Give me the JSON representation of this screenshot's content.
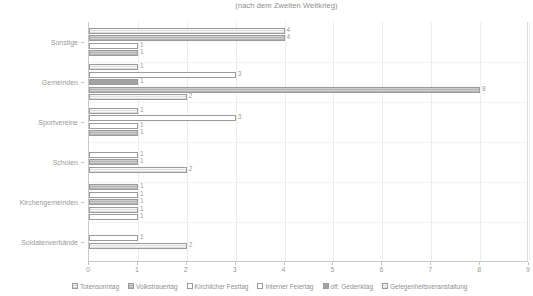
{
  "chart_data": {
    "type": "bar",
    "orientation": "horizontal",
    "title": "(nach dem Zweiten Weltkrieg)",
    "xlabel": "",
    "ylabel": "",
    "xlim": [
      0,
      9
    ],
    "xticks": [
      "0",
      "1",
      "2",
      "3",
      "4",
      "5",
      "6",
      "7",
      "8",
      "9"
    ],
    "grid": true,
    "legend_position": "bottom",
    "categories": [
      "Sonstige",
      "Gemeinden",
      "Sportvereine",
      "Schulen",
      "Kirchengemeinden",
      "Soldatenverbände"
    ],
    "series": [
      {
        "name": "Totensonntag",
        "values": [
          4,
          1,
          1,
          1,
          1,
          0
        ]
      },
      {
        "name": "Volkstrauertag",
        "values": [
          4,
          3,
          3,
          2,
          1,
          1
        ]
      },
      {
        "name": "Kirchlicher Festtag",
        "values": [
          1,
          1,
          1,
          0,
          1,
          2
        ]
      },
      {
        "name": "Interner Feiertag",
        "values": [
          0,
          8,
          1,
          0,
          1,
          0
        ]
      },
      {
        "name": "off. Gedenktag",
        "values": [
          1,
          2,
          0,
          0,
          1,
          0
        ]
      },
      {
        "name": "Gelegenheitsveranstaltung",
        "values": [
          0,
          0,
          0,
          0,
          0,
          0
        ]
      }
    ],
    "bars": [
      {
        "category": "Sonstige",
        "series": "Totensonntag",
        "value": 4,
        "label": "4",
        "fill": 5
      },
      {
        "category": "Sonstige",
        "series": "Volkstrauertag",
        "value": 4,
        "label": "4",
        "fill": 1
      },
      {
        "category": "Sonstige",
        "series": "Kirchlicher Festtag",
        "value": 1,
        "label": "1",
        "fill": 2
      },
      {
        "category": "Sonstige",
        "series": "off. Gedenktag",
        "value": 1,
        "label": "1",
        "fill": 1
      },
      {
        "category": "Gemeinden",
        "series": "Totensonntag",
        "value": 1,
        "label": "1",
        "fill": 5
      },
      {
        "category": "Gemeinden",
        "series": "Volkstrauertag",
        "value": 3,
        "label": "3",
        "fill": 2
      },
      {
        "category": "Gemeinden",
        "series": "Kirchlicher Festtag",
        "value": 1,
        "label": "1",
        "fill": 4
      },
      {
        "category": "Gemeinden",
        "series": "Interner Feiertag",
        "value": 8,
        "label": "8",
        "fill": 1
      },
      {
        "category": "Gemeinden",
        "series": "off. Gedenktag",
        "value": 2,
        "label": "2",
        "fill": 5
      },
      {
        "category": "Sportvereine",
        "series": "Totensonntag",
        "value": 1,
        "label": "1",
        "fill": 5
      },
      {
        "category": "Sportvereine",
        "series": "Volkstrauertag",
        "value": 3,
        "label": "3",
        "fill": 2
      },
      {
        "category": "Sportvereine",
        "series": "Kirchlicher Festtag",
        "value": 1,
        "label": "1",
        "fill": 2
      },
      {
        "category": "Sportvereine",
        "series": "Interner Feiertag",
        "value": 1,
        "label": "1",
        "fill": 1
      },
      {
        "category": "Schulen",
        "series": "Totensonntag",
        "value": 1,
        "label": "1",
        "fill": 2
      },
      {
        "category": "Schulen",
        "series": "Volkstrauertag",
        "value": 1,
        "label": "1",
        "fill": 1
      },
      {
        "category": "Schulen",
        "series": "Kirchlicher Festtag",
        "value": 2,
        "label": "2",
        "fill": 5
      },
      {
        "category": "Kirchengemeinden",
        "series": "Totensonntag",
        "value": 1,
        "label": "1",
        "fill": 1
      },
      {
        "category": "Kirchengemeinden",
        "series": "Volkstrauertag",
        "value": 1,
        "label": "1",
        "fill": 2
      },
      {
        "category": "Kirchengemeinden",
        "series": "Kirchlicher Festtag",
        "value": 1,
        "label": "1",
        "fill": 1
      },
      {
        "category": "Kirchengemeinden",
        "series": "Interner Feiertag",
        "value": 1,
        "label": "1",
        "fill": 5
      },
      {
        "category": "Kirchengemeinden",
        "series": "off. Gedenktag",
        "value": 1,
        "label": "1",
        "fill": 2
      },
      {
        "category": "Soldatenverbände",
        "series": "Totensonntag",
        "value": 1,
        "label": "1",
        "fill": 2
      },
      {
        "category": "Soldatenverbände",
        "series": "Volkstrauertag",
        "value": 2,
        "label": "2",
        "fill": 5
      }
    ]
  },
  "legend": {
    "items": [
      {
        "label": "Totensonntag",
        "fill": 0
      },
      {
        "label": "Volkstrauertag",
        "fill": 1
      },
      {
        "label": "Kirchlicher Festtag",
        "fill": 2
      },
      {
        "label": "Interner Feiertag",
        "fill": 3
      },
      {
        "label": "off. Gedenktag",
        "fill": 4
      },
      {
        "label": "Gelegenheitsveranstaltung",
        "fill": 5
      }
    ]
  },
  "colors": {
    "axis": "#c9c9c9",
    "grid": "#ececec",
    "text": "#9a9a9a",
    "bar_border": "#9b9b9b"
  }
}
